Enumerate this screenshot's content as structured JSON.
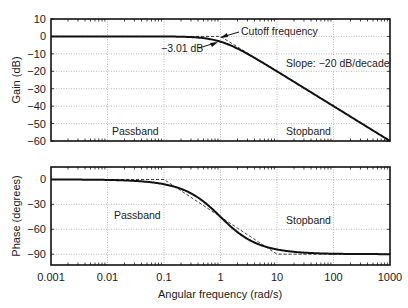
{
  "chart_data": [
    {
      "type": "line",
      "title": "",
      "xlabel": "",
      "ylabel": "Gain (dB)",
      "xscale": "log",
      "xlim": [
        0.001,
        1000
      ],
      "ylim": [
        -60,
        10
      ],
      "xticks": [
        0.001,
        0.01,
        0.1,
        1,
        10,
        100,
        1000
      ],
      "yticks": [
        10,
        0,
        -10,
        -20,
        -30,
        -40,
        -50,
        -60
      ],
      "ytick_labels": [
        "10",
        "0",
        "−10",
        "−20",
        "−30",
        "−40",
        "−50",
        "−60"
      ],
      "grid": true,
      "series": [
        {
          "name": "Actual gain",
          "style": "solid",
          "x": [
            0.001,
            0.01,
            0.1,
            0.3,
            0.5,
            1,
            2,
            3,
            5,
            10,
            100,
            1000
          ],
          "values": [
            0,
            0,
            -0.04,
            -0.37,
            -0.97,
            -3.01,
            -6.99,
            -10.0,
            -14.15,
            -20.04,
            -40.0,
            -60.0
          ]
        },
        {
          "name": "Asymptotic approximation",
          "style": "dashed",
          "x": [
            0.001,
            1,
            1000
          ],
          "values": [
            0,
            0,
            -60
          ]
        }
      ],
      "annotations": [
        {
          "text": "Cutoff frequency",
          "arrow_to": [
            1,
            0
          ]
        },
        {
          "text": "−3.01 dB",
          "arrow_to": [
            1,
            -3.01
          ]
        },
        {
          "text": "Slope: −20 dB/decade"
        },
        {
          "text": "Passband"
        },
        {
          "text": "Stopband"
        }
      ]
    },
    {
      "type": "line",
      "title": "",
      "xlabel": "Angular frequency (rad/s)",
      "ylabel": "Phase (degrees)",
      "xscale": "log",
      "xlim": [
        0.001,
        1000
      ],
      "ylim": [
        -103,
        15
      ],
      "xticks": [
        0.001,
        0.01,
        0.1,
        1,
        10,
        100,
        1000
      ],
      "xtick_labels": [
        "0.001",
        "0.01",
        "0.1",
        "1",
        "10",
        "100",
        "1000"
      ],
      "yticks": [
        0,
        -30,
        -60,
        -90
      ],
      "ytick_labels": [
        "0",
        "−30",
        "−60",
        "−90"
      ],
      "grid": true,
      "series": [
        {
          "name": "Actual phase",
          "style": "solid",
          "x": [
            0.001,
            0.01,
            0.03,
            0.1,
            0.2,
            0.3,
            0.5,
            1,
            2,
            3,
            5,
            10,
            30,
            100,
            1000
          ],
          "values": [
            -0.06,
            -0.57,
            -1.72,
            -5.71,
            -11.31,
            -16.7,
            -26.57,
            -45,
            -63.43,
            -71.57,
            -78.69,
            -84.29,
            -88.09,
            -89.43,
            -89.94
          ]
        },
        {
          "name": "Asymptotic approximation",
          "style": "dashed",
          "x": [
            0.001,
            0.1,
            10,
            1000
          ],
          "values": [
            0,
            0,
            -90,
            -90
          ]
        }
      ],
      "annotations": [
        {
          "text": "Passband"
        },
        {
          "text": "Stopband"
        }
      ]
    }
  ],
  "labels": {
    "gain_ylabel": "Gain (dB)",
    "phase_ylabel": "Phase (degrees)",
    "xlabel": "Angular frequency (rad/s)",
    "cutoff": "Cutoff frequency",
    "minus3db": "−3.01 dB",
    "slope": "Slope: −20 dB/decade",
    "passband": "Passband",
    "stopband": "Stopband"
  },
  "colors": {
    "line": "#111111",
    "grid": "#9a9a9a",
    "axis": "#111111",
    "text": "#1a1a1a",
    "background": "#ffffff"
  }
}
